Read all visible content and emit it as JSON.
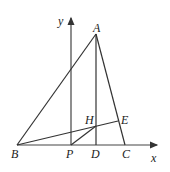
{
  "diagram": {
    "type": "geometry",
    "axes": {
      "x_label": "x",
      "y_label": "y"
    },
    "points": {
      "A": {
        "label": "A",
        "x": 96,
        "y": 34
      },
      "B": {
        "label": "B",
        "x": 17,
        "y": 145
      },
      "C": {
        "label": "C",
        "x": 125,
        "y": 145
      },
      "D": {
        "label": "D",
        "x": 96,
        "y": 145
      },
      "E": {
        "label": "E",
        "x": 118,
        "y": 121
      },
      "H": {
        "label": "H",
        "x": 96,
        "y": 126
      },
      "P": {
        "label": "P",
        "x": 71,
        "y": 145
      }
    },
    "segments": [
      "AB",
      "AC",
      "BC",
      "AD",
      "BE",
      "PH"
    ],
    "colors": {
      "line": "#333333",
      "axis": "#444444",
      "text": "#222222",
      "background": "#ffffff"
    }
  }
}
